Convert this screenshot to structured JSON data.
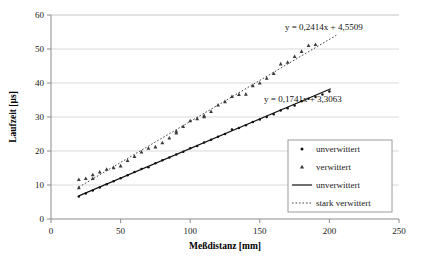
{
  "chart_data": {
    "type": "scatter",
    "title": "",
    "subtitle": "",
    "xlabel": "Meßdistanz [mm]",
    "ylabel": "Laufzeit [µs]",
    "xlim": [
      0,
      250
    ],
    "ylim": [
      0,
      60
    ],
    "xticks": [
      0,
      50,
      100,
      150,
      200,
      250
    ],
    "yticks": [
      0,
      10,
      20,
      30,
      40,
      50,
      60
    ],
    "grid": "horizontal",
    "legend_position": "bottom-right",
    "legend_entries": [
      {
        "label": "unverwittert",
        "marker": "dot",
        "style": "marker"
      },
      {
        "label": "verwittert",
        "marker": "triangle",
        "style": "marker"
      },
      {
        "label": "unverwittert",
        "marker": "line-solid",
        "style": "line"
      },
      {
        "label": "stark verwittert",
        "marker": "line-dotted",
        "style": "line"
      }
    ],
    "annotations": [
      {
        "text": "y = 0,2414x + 4,5509",
        "x": 196,
        "y": 55.5,
        "series": "stark verwittert"
      },
      {
        "text": "y = 0,1741x + 3,3063",
        "x": 181,
        "y": 34.5,
        "series": "unverwittert"
      }
    ],
    "series": [
      {
        "name": "unverwittert",
        "marker": "dot",
        "trendline": {
          "slope": 0.1741,
          "intercept": 3.3063,
          "style": "solid",
          "x_from": 20,
          "x_to": 201
        },
        "x": [
          20,
          25,
          30,
          35,
          40,
          45,
          50,
          55,
          60,
          65,
          70,
          75,
          80,
          85,
          90,
          95,
          100,
          105,
          110,
          115,
          120,
          125,
          130,
          135,
          140,
          145,
          150,
          155,
          160,
          165,
          170,
          175,
          180,
          185,
          190,
          195,
          200
        ],
        "y": [
          6.6,
          7.5,
          8.4,
          9.3,
          10.2,
          11.1,
          12.0,
          12.9,
          13.8,
          14.7,
          15.2,
          16.4,
          17.3,
          18.1,
          19.0,
          19.8,
          20.8,
          21.5,
          22.5,
          23.3,
          24.2,
          25.0,
          26.3,
          26.8,
          27.6,
          28.5,
          29.3,
          30.0,
          30.8,
          31.9,
          32.6,
          33.4,
          34.6,
          35.4,
          35.9,
          36.6,
          37.5
        ]
      },
      {
        "name": "verwittert",
        "marker": "triangle",
        "trendline": {
          "slope": 0.2414,
          "intercept": 4.5509,
          "style": "dotted",
          "x_from": 20,
          "x_to": 205
        },
        "x": [
          20,
          20,
          25,
          30,
          30,
          35,
          40,
          45,
          50,
          55,
          60,
          65,
          70,
          75,
          80,
          85,
          90,
          90,
          95,
          100,
          105,
          110,
          110,
          115,
          120,
          125,
          130,
          135,
          140,
          145,
          150,
          155,
          160,
          165,
          170,
          175,
          180,
          185,
          190
        ],
        "y": [
          9.2,
          11.6,
          11.9,
          11.9,
          13.0,
          13.8,
          14.6,
          15.1,
          15.6,
          17.2,
          18.4,
          19.7,
          20.8,
          21.2,
          22.4,
          23.8,
          25.3,
          25.8,
          27.2,
          28.9,
          29.5,
          30.1,
          30.4,
          31.6,
          33.5,
          34.5,
          36.0,
          36.6,
          36.7,
          39.2,
          40.0,
          41.4,
          42.8,
          45.6,
          46.1,
          47.8,
          49.3,
          51.0,
          51.3
        ]
      }
    ]
  }
}
